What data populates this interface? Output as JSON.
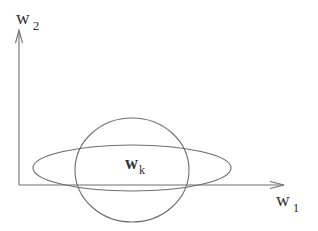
{
  "diagram": {
    "stroke_color": "#6e6e6e",
    "axes": {
      "y_axis": {
        "label": "w",
        "subscript": "2"
      },
      "x_axis": {
        "label": "w",
        "subscript": "1"
      }
    },
    "shapes": [
      {
        "type": "circle",
        "center": [
          132,
          170
        ],
        "rx": 57,
        "ry": 52
      },
      {
        "type": "ellipse",
        "center": [
          132,
          168
        ],
        "rx": 99,
        "ry": 23
      }
    ],
    "center_label": {
      "label": "w",
      "subscript": "k",
      "bold": true
    }
  }
}
